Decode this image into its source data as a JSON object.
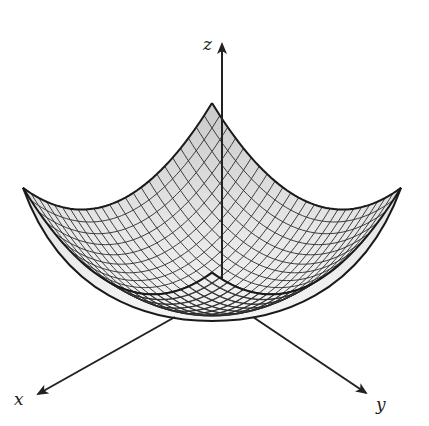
{
  "figure": {
    "surface": {
      "equation": "z = x^2 + y^2",
      "domain": {
        "u": [
          -1,
          1
        ],
        "v": [
          -1,
          1
        ]
      },
      "grid_lines": 24,
      "fill_color": "#c9c9c9",
      "fill_color_light": "#e6e6e6",
      "mesh_color": "#2a2a2a",
      "edge_color": "#1a1a1a"
    },
    "projection": {
      "origin": [
        212,
        300
      ],
      "x_dir": [
        -94.5,
        42.4
      ],
      "y_dir": [
        94.5,
        42.4
      ],
      "z_dir": [
        0,
        -56.1
      ]
    },
    "axes": {
      "color": "#222222",
      "x": {
        "label": "x",
        "from": [
          175,
          317
        ],
        "to": [
          38,
          394
        ],
        "label_pos": [
          14,
          405
        ]
      },
      "y": {
        "label": "y",
        "from": [
          253,
          317
        ],
        "to": [
          366,
          393
        ],
        "label_pos": [
          376,
          410
        ]
      },
      "z": {
        "label": "z",
        "from": [
          222,
          280
        ],
        "to": [
          222,
          44
        ],
        "label_pos": [
          203,
          50
        ]
      }
    }
  }
}
